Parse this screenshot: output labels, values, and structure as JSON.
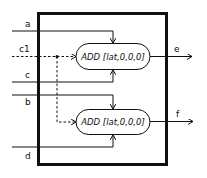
{
  "diagram": {
    "inputs": [
      {
        "id": "a",
        "label": "a",
        "style": "solid",
        "target": "add_top",
        "port": "top"
      },
      {
        "id": "c1",
        "label": "c1",
        "style": "dashed",
        "target": [
          "add_top",
          "add_bottom"
        ],
        "port": "left"
      },
      {
        "id": "c",
        "label": "c",
        "style": "solid",
        "target": "add_top",
        "port": "bottom"
      },
      {
        "id": "b",
        "label": "b",
        "style": "solid",
        "target": "add_bottom",
        "port": "top"
      },
      {
        "id": "d",
        "label": "d",
        "style": "solid",
        "target": "add_bottom",
        "port": "bottom"
      }
    ],
    "nodes": [
      {
        "id": "add_top",
        "label": "ADD [lat,0,0,0]"
      },
      {
        "id": "add_bottom",
        "label": "ADD [lat,0,0,0]"
      }
    ],
    "outputs": [
      {
        "id": "e",
        "label": "e",
        "source": "add_top"
      },
      {
        "id": "f",
        "label": "f",
        "source": "add_bottom"
      }
    ]
  }
}
